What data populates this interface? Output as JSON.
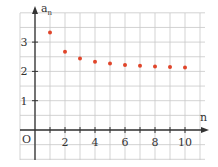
{
  "chart_data": {
    "type": "scatter",
    "title": "",
    "xlabel": "n",
    "ylabel": "a_n",
    "ylabel_main": "a",
    "ylabel_sub": "n",
    "origin_label": "O",
    "x": [
      1,
      2,
      3,
      4,
      5,
      6,
      7,
      8,
      9,
      10
    ],
    "series": [
      {
        "name": "a_n",
        "values": [
          3.33,
          2.67,
          2.44,
          2.33,
          2.27,
          2.22,
          2.19,
          2.17,
          2.15,
          2.13
        ]
      }
    ],
    "x_ticks": [
      {
        "value": 2,
        "label": "2"
      },
      {
        "value": 4,
        "label": "4"
      },
      {
        "value": 6,
        "label": "6"
      },
      {
        "value": 8,
        "label": "8"
      },
      {
        "value": 10,
        "label": "10"
      }
    ],
    "y_ticks": [
      {
        "value": 1,
        "label": "1"
      },
      {
        "value": 2,
        "label": "2"
      },
      {
        "value": 3,
        "label": "3"
      }
    ],
    "xlim": [
      -1,
      11
    ],
    "ylim": [
      -1,
      4
    ],
    "grid": true,
    "grid_step_x": 1,
    "grid_step_y": 0.5,
    "legend": "none",
    "colors": {
      "points": "#e0452a",
      "axis": "#333333",
      "grid": "#c8c8c8"
    }
  }
}
